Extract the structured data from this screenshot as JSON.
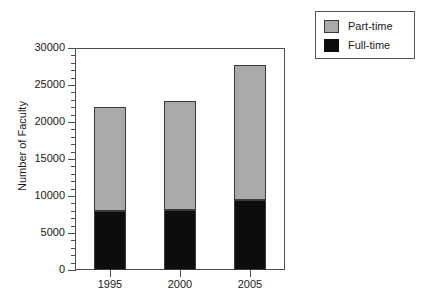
{
  "chart_data": {
    "type": "bar",
    "subtype": "stacked-vertical",
    "title": "",
    "xlabel": "",
    "ylabel": "Number of Faculty",
    "categories": [
      "1995",
      "2000",
      "2005"
    ],
    "series": [
      {
        "name": "Full-time",
        "color": "#0d0d0d",
        "values": [
          8000,
          8100,
          9500
        ]
      },
      {
        "name": "Part-time",
        "color": "#a9a9a9",
        "values": [
          14000,
          14800,
          18200
        ]
      }
    ],
    "totals": [
      22000,
      22900,
      27700
    ],
    "stack_order": [
      "Full-time",
      "Part-time"
    ],
    "ylim": [
      0,
      30000
    ],
    "ytick_values": [
      0,
      5000,
      10000,
      15000,
      20000,
      25000,
      30000
    ],
    "ytick_labels": [
      "0",
      "5000",
      "10000",
      "15000",
      "20000",
      "25000",
      "30000"
    ],
    "yminor_ticks": [
      1000,
      2000,
      3000,
      4000,
      6000,
      7000,
      8000,
      9000,
      11000,
      12000,
      13000,
      14000,
      16000,
      17000,
      18000,
      19000,
      21000,
      22000,
      23000,
      24000,
      26000,
      27000,
      28000,
      29000
    ],
    "grid": false,
    "legend_position": "top-right",
    "legend_entries": [
      {
        "label": "Part-time",
        "swatch": "#a9a9a9"
      },
      {
        "label": "Full-time",
        "swatch": "#0d0d0d"
      }
    ],
    "axis_color": "#4d4d4d",
    "frame": true
  }
}
